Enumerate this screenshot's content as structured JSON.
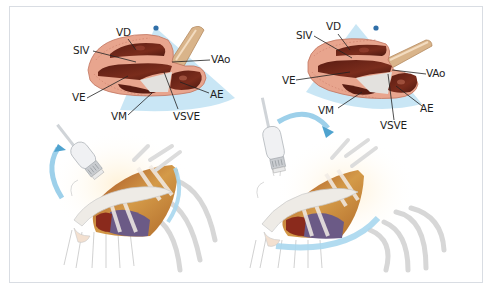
{
  "figure": {
    "panels": [
      {
        "id": "left",
        "view": "parasternal long-axis, initial probe position",
        "labels": {
          "vd": "VD",
          "siv": "SIV",
          "vao": "VAo",
          "ve": "VE",
          "ae": "AE",
          "vm": "VM",
          "vsve": "VSVE"
        },
        "rotation_arrow": "counter-clockwise arc left of probe"
      },
      {
        "id": "right",
        "view": "parasternal long-axis, probe rotated",
        "labels": {
          "vd": "VD",
          "siv": "SIV",
          "vao": "VAo",
          "ve": "VE",
          "ae": "AE",
          "vm": "VM",
          "vsve": "VSVE"
        },
        "rotation_arrow": "clockwise arc over probe"
      }
    ],
    "colors": {
      "myocardium": "#e8a58e",
      "myocardium_stripe": "#c97a66",
      "cavity": "#6e2418",
      "cavity_highlight": "#a04a38",
      "sector_blue": "#a9d7ee",
      "arrow_blue": "#4fa3cf",
      "dot_blue": "#2f6fa8",
      "aorta": "#d9b48a",
      "bone": "#ececec",
      "bone_outline": "#c8c8c8",
      "heart_gold": "#c98a3a",
      "heart_purple": "#6b5a86",
      "heart_red": "#8a2a1c",
      "label_text": "#1e1e1e",
      "leader_line": "#222222",
      "frame_border": "#d9dde3"
    }
  }
}
